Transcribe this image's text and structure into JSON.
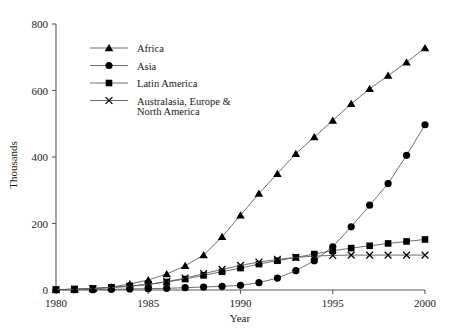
{
  "chart_data": {
    "type": "line",
    "title": "",
    "xlabel": "Year",
    "ylabel": "Thousands",
    "xlim": [
      1980,
      2000
    ],
    "ylim": [
      0,
      800
    ],
    "xticks": [
      1980,
      1985,
      1990,
      1995,
      2000
    ],
    "yticks": [
      0,
      200,
      400,
      600,
      800
    ],
    "grid": false,
    "legend_position": "upper-left-inside",
    "x": [
      1980,
      1981,
      1982,
      1983,
      1984,
      1985,
      1986,
      1987,
      1988,
      1989,
      1990,
      1991,
      1992,
      1993,
      1994,
      1995,
      1996,
      1997,
      1998,
      1999,
      2000
    ],
    "series": [
      {
        "name": "Africa",
        "marker": "triangle",
        "values": [
          1,
          2,
          4,
          9,
          18,
          30,
          48,
          73,
          105,
          160,
          225,
          290,
          350,
          410,
          460,
          510,
          560,
          605,
          645,
          685,
          728
        ]
      },
      {
        "name": "Asia",
        "marker": "circle",
        "values": [
          0,
          1,
          1,
          2,
          3,
          4,
          5,
          7,
          9,
          11,
          14,
          22,
          36,
          58,
          88,
          130,
          190,
          255,
          320,
          405,
          497
        ]
      },
      {
        "name": "Latin America",
        "marker": "square",
        "values": [
          1,
          3,
          5,
          8,
          12,
          17,
          24,
          33,
          44,
          55,
          66,
          78,
          88,
          98,
          108,
          118,
          126,
          133,
          140,
          146,
          152
        ]
      },
      {
        "name": "Australasia, Europe & North America",
        "marker": "cross",
        "values": [
          1,
          2,
          4,
          7,
          11,
          17,
          25,
          36,
          49,
          62,
          74,
          84,
          92,
          98,
          102,
          104,
          105,
          105,
          105,
          105,
          105
        ]
      }
    ]
  },
  "legend": {
    "items": [
      {
        "label": "Africa",
        "marker": "triangle"
      },
      {
        "label": "Asia",
        "marker": "circle"
      },
      {
        "label": "Latin America",
        "marker": "square"
      },
      {
        "label": "Australasia, Europe &",
        "label2": "North America",
        "marker": "cross"
      }
    ]
  },
  "axes": {
    "y_title": "Thousands",
    "x_title": "Year",
    "y_tick_labels": [
      "800",
      "600",
      "400",
      "200",
      "0"
    ],
    "x_tick_labels": [
      "1980",
      "1985",
      "1990",
      "1995",
      "2000"
    ]
  },
  "colors": {
    "line": "#5f5f5f",
    "marker": "#000000",
    "axis": "#5a5a5a",
    "text": "#1a1a1a",
    "background": "#ffffff"
  }
}
